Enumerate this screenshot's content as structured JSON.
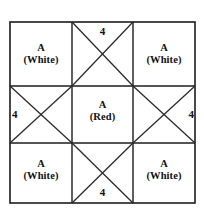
{
  "figure": {
    "type": "geometric-grid-diagram",
    "rows": 3,
    "columns": 3,
    "outline_color": "#1c1c1c",
    "background_color": "#ffffff",
    "grid": {
      "left": 10,
      "top": 22,
      "right": 195,
      "bottom": 203,
      "vertical_divider_1": 72,
      "vertical_divider_2": 133,
      "horizontal_divider_1": 86,
      "horizontal_divider_2": 143
    },
    "cells": [
      {
        "position": "top-left",
        "row": 0,
        "column": 0,
        "label_line_1": "A",
        "label_line_2": "(White)",
        "has_diagonals": false,
        "count": ""
      },
      {
        "position": "top-center",
        "row": 0,
        "column": 1,
        "label_line_1": "",
        "label_line_2": "",
        "has_diagonals": true,
        "count": "4"
      },
      {
        "position": "top-right",
        "row": 0,
        "column": 2,
        "label_line_1": "A",
        "label_line_2": "(White)",
        "has_diagonals": false,
        "count": ""
      },
      {
        "position": "middle-left",
        "row": 1,
        "column": 0,
        "label_line_1": "",
        "label_line_2": "",
        "has_diagonals": true,
        "count": "4"
      },
      {
        "position": "middle-center",
        "row": 1,
        "column": 1,
        "label_line_1": "A",
        "label_line_2": "(Red)",
        "has_diagonals": false,
        "count": ""
      },
      {
        "position": "middle-right",
        "row": 1,
        "column": 2,
        "label_line_1": "",
        "label_line_2": "",
        "has_diagonals": true,
        "count": "4"
      },
      {
        "position": "bottom-left",
        "row": 2,
        "column": 0,
        "label_line_1": "A",
        "label_line_2": "(White)",
        "has_diagonals": false,
        "count": ""
      },
      {
        "position": "bottom-center",
        "row": 2,
        "column": 1,
        "label_line_1": "",
        "label_line_2": "",
        "has_diagonals": true,
        "count": "4"
      },
      {
        "position": "bottom-right",
        "row": 2,
        "column": 2,
        "label_line_1": "A",
        "label_line_2": "(White)",
        "has_diagonals": false,
        "count": ""
      }
    ]
  }
}
